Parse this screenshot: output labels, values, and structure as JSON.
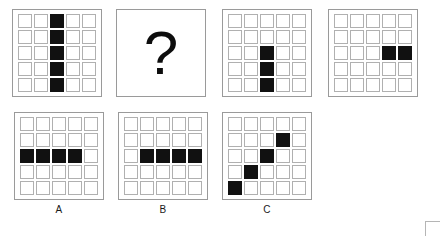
{
  "puzzle": {
    "type": "matrix-reasoning-visual-analogy",
    "grid_size": 5,
    "colors": {
      "filled": "#111111",
      "empty": "#ffffff",
      "cell_border": "#b0b0b0",
      "panel_border": "#9a9a9a",
      "background": "#ffffff",
      "text": "#1a1a1a"
    },
    "sequence": [
      {
        "id": "panel-1",
        "kind": "grid",
        "description": "vertical-line-column-3",
        "cells": [
          [
            0,
            0,
            1,
            0,
            0
          ],
          [
            0,
            0,
            1,
            0,
            0
          ],
          [
            0,
            0,
            1,
            0,
            0
          ],
          [
            0,
            0,
            1,
            0,
            0
          ],
          [
            0,
            0,
            1,
            0,
            0
          ]
        ]
      },
      {
        "id": "panel-2",
        "kind": "question",
        "description": "unknown-answer-slot",
        "glyph": "?"
      },
      {
        "id": "panel-3",
        "kind": "grid",
        "description": "partial-vertical-column-3-rows-3-to-5",
        "cells": [
          [
            0,
            0,
            0,
            0,
            0
          ],
          [
            0,
            0,
            0,
            0,
            0
          ],
          [
            0,
            0,
            1,
            0,
            0
          ],
          [
            0,
            0,
            1,
            0,
            0
          ],
          [
            0,
            0,
            1,
            0,
            0
          ]
        ]
      },
      {
        "id": "panel-4",
        "kind": "grid",
        "description": "horizontal-pair-row-3-columns-4-and-5",
        "cells": [
          [
            0,
            0,
            0,
            0,
            0
          ],
          [
            0,
            0,
            0,
            0,
            0
          ],
          [
            0,
            0,
            0,
            1,
            1
          ],
          [
            0,
            0,
            0,
            0,
            0
          ],
          [
            0,
            0,
            0,
            0,
            0
          ]
        ]
      }
    ],
    "options": [
      {
        "id": "option-a",
        "label": "A",
        "kind": "grid",
        "description": "horizontal-line-row-3-columns-1-to-4",
        "cells": [
          [
            0,
            0,
            0,
            0,
            0
          ],
          [
            0,
            0,
            0,
            0,
            0
          ],
          [
            1,
            1,
            1,
            1,
            0
          ],
          [
            0,
            0,
            0,
            0,
            0
          ],
          [
            0,
            0,
            0,
            0,
            0
          ]
        ]
      },
      {
        "id": "option-b",
        "label": "B",
        "kind": "grid",
        "description": "horizontal-line-row-3-columns-2-to-5",
        "cells": [
          [
            0,
            0,
            0,
            0,
            0
          ],
          [
            0,
            0,
            0,
            0,
            0
          ],
          [
            0,
            1,
            1,
            1,
            1
          ],
          [
            0,
            0,
            0,
            0,
            0
          ],
          [
            0,
            0,
            0,
            0,
            0
          ]
        ]
      },
      {
        "id": "option-c",
        "label": "C",
        "kind": "grid",
        "description": "anti-diagonal-four-cells",
        "cells": [
          [
            0,
            0,
            0,
            0,
            0
          ],
          [
            0,
            0,
            0,
            1,
            0
          ],
          [
            0,
            0,
            1,
            0,
            0
          ],
          [
            0,
            1,
            0,
            0,
            0
          ],
          [
            1,
            0,
            0,
            0,
            0
          ]
        ]
      }
    ]
  }
}
